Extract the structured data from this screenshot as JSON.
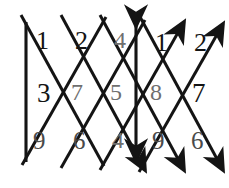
{
  "figure": {
    "width": 229,
    "height": 188,
    "background_color": "#ffffff",
    "stroke_color": "#141414"
  },
  "labels": {
    "top_left_1": "1",
    "top_left_2": "2",
    "top_center_4": "4",
    "top_right_1": "1",
    "top_right_2": "2",
    "mid_left_3": "3",
    "mid_7": "7",
    "mid_5": "5",
    "mid_8": "8",
    "mid_right_7": "7",
    "bottom_left_9": "9",
    "bottom_6": "6",
    "bottom_center_4": "4",
    "bottom_right_9": "9",
    "bottom_right_6": "6"
  }
}
